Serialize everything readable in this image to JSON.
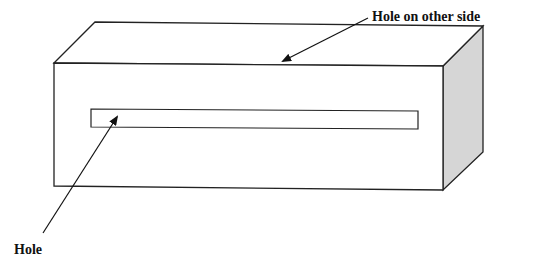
{
  "diagram": {
    "type": "3d-box-with-slot",
    "labels": {
      "hole_other_side": "Hole on other side",
      "hole": "Hole"
    },
    "colors": {
      "line": "#222222",
      "side_face_fill": "#d6d6d6",
      "background": "#ffffff"
    }
  }
}
